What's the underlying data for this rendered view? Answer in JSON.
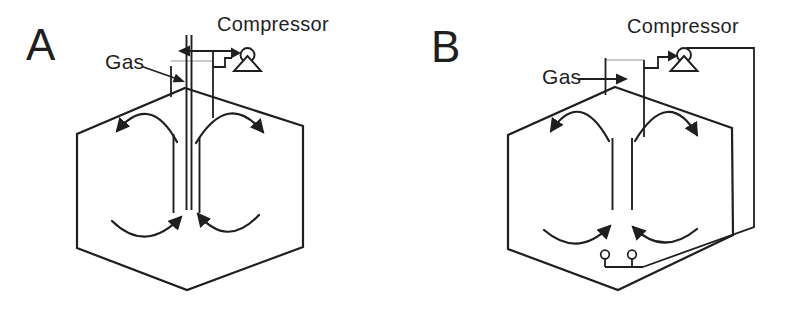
{
  "canvas": {
    "width": 790,
    "height": 322,
    "background": "#ffffff",
    "ink": "#1f1f1f",
    "faint_line": "#b8b8b8"
  },
  "diagram_a": {
    "label": "A",
    "compressor_label": "Compressor",
    "gas_label": "Gas"
  },
  "diagram_b": {
    "label": "B",
    "compressor_label": "Compressor",
    "gas_label": "Gas"
  }
}
